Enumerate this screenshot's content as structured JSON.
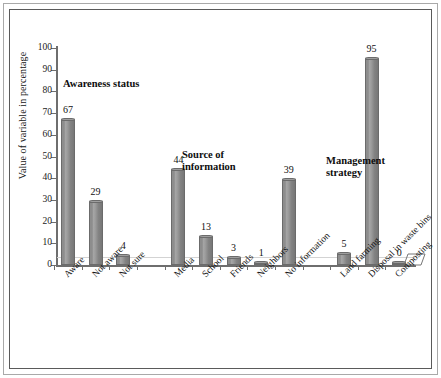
{
  "chart_data": {
    "type": "bar",
    "title": "",
    "xlabel": "",
    "ylabel": "Value of variable in percentage",
    "ylim": [
      0,
      100
    ],
    "ytick_step": 10,
    "yticks": [
      0,
      10,
      20,
      30,
      40,
      50,
      60,
      70,
      80,
      90,
      100
    ],
    "grid": false,
    "legend": "none",
    "bar_color": "#8d8d8d",
    "categories": [
      "Aware",
      "Not aware",
      "Not sure",
      "Media",
      "School",
      "Friends",
      "Neighbors",
      "No information",
      "Land farming",
      "Disposal in waste bins",
      "Composting"
    ],
    "values": [
      67,
      29,
      4,
      44,
      13,
      3,
      1,
      39,
      5,
      95,
      0
    ],
    "slots": [
      {
        "label": "Aware",
        "value": 67,
        "group": "Awareness status"
      },
      {
        "label": "Not aware",
        "value": 29,
        "group": "Awareness status"
      },
      {
        "label": "Not sure",
        "value": 4,
        "group": "Awareness status"
      },
      {
        "label": "",
        "value": null,
        "group": ""
      },
      {
        "label": "Media",
        "value": 44,
        "group": "Source of information"
      },
      {
        "label": "School",
        "value": 13,
        "group": "Source of information"
      },
      {
        "label": "Friends",
        "value": 3,
        "group": "Source of information"
      },
      {
        "label": "Neighbors",
        "value": 1,
        "group": "Source of information"
      },
      {
        "label": "No information",
        "value": 39,
        "group": "Source of information"
      },
      {
        "label": "",
        "value": null,
        "group": ""
      },
      {
        "label": "Land farming",
        "value": 5,
        "group": "Management strategy"
      },
      {
        "label": "Disposal in waste bins",
        "value": 95,
        "group": "Management strategy"
      },
      {
        "label": "Composting",
        "value": 0,
        "group": "Management strategy"
      }
    ],
    "annotations": [
      {
        "text": "Awareness status",
        "group": "Awareness status"
      },
      {
        "text": "Source of\ninformation",
        "group": "Source of information"
      },
      {
        "text": "Management\nstrategy",
        "group": "Management strategy"
      }
    ]
  }
}
